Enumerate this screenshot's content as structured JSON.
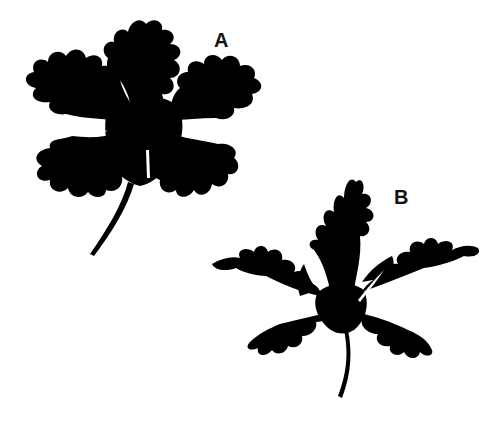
{
  "figure": {
    "panels": [
      {
        "id": "A",
        "label": "A",
        "subject": "leaf-silhouette",
        "description": "Palmately lobed leaf with broad, rounded crenate lobes and curved petiole"
      },
      {
        "id": "B",
        "label": "B",
        "subject": "leaf-silhouette",
        "description": "Palmately lobed leaf with narrow, deeply dissected pointed lobes and curved petiole"
      }
    ],
    "colors": {
      "background": "#ffffff",
      "silhouette": "#000000",
      "label": "#111111"
    }
  }
}
